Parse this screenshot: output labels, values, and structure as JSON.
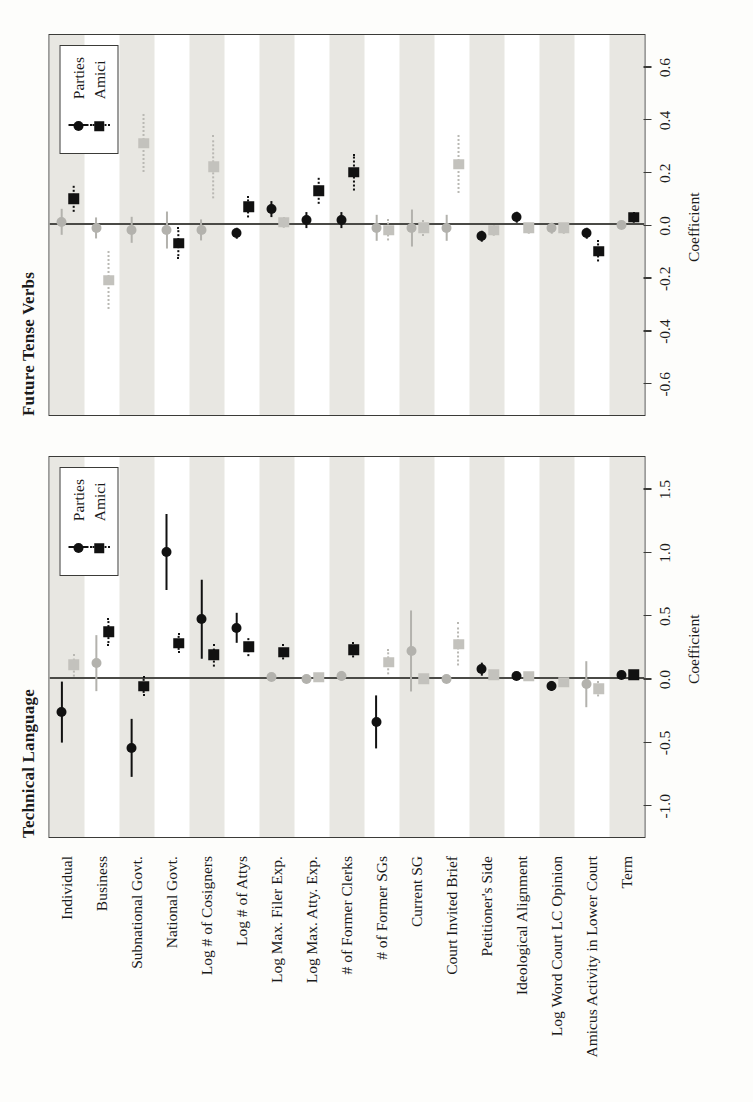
{
  "figure": {
    "orientation": "rotated-90-ccw",
    "xlabel": "Coefficient",
    "colors": {
      "significant": "#111111",
      "nonsignificant": "#b8b7b2",
      "band": "#e8e7e2",
      "frame": "#3b3b38"
    }
  },
  "legend": {
    "entries": [
      {
        "label": "Parties",
        "marker": "circle",
        "line": "solid"
      },
      {
        "label": "Amici",
        "marker": "square",
        "line": "dotted"
      }
    ]
  },
  "categories": [
    "Individual",
    "Business",
    "Subnational Govt.",
    "National Govt.",
    "Log # of Cosigners",
    "Log # of Attys",
    "Log Max. Filer Exp.",
    "Log Max. Atty. Exp.",
    "# of Former Clerks",
    "# of Former SGs",
    "Current SG",
    "Court Invited Brief",
    "Petitioner's Side",
    "Ideological Alignment",
    "Log Word Court LC Opinion",
    "Amicus Activity in Lower Court",
    "Term"
  ],
  "chart_data": [
    {
      "type": "scatter",
      "title": "Technical Language",
      "xlabel": "Coefficient",
      "ylabel": "",
      "xlim": [
        -1.25,
        1.75
      ],
      "xticks": [
        -1.0,
        -0.5,
        0.0,
        0.5,
        1.0,
        1.5
      ],
      "xticklabels": [
        "-1.0",
        "-0.5",
        "0.0",
        "0.5",
        "1.0",
        "1.5"
      ],
      "grid": false,
      "categories": [
        "Individual",
        "Business",
        "Subnational Govt.",
        "National Govt.",
        "Log # of Cosigners",
        "Log # of Attys",
        "Log Max. Filer Exp.",
        "Log Max. Atty. Exp.",
        "# of Former Clerks",
        "# of Former SGs",
        "Current SG",
        "Court Invited Brief",
        "Petitioner's Side",
        "Ideological Alignment",
        "Log Word Court LC Opinion",
        "Amicus Activity in Lower Court",
        "Term"
      ],
      "series": [
        {
          "name": "Parties",
          "marker": "circle",
          "line": "solid",
          "values": [
            -0.26,
            0.12,
            -0.55,
            1.0,
            0.47,
            0.4,
            0.01,
            0.0,
            0.02,
            -0.34,
            0.22,
            0.0,
            0.08,
            0.02,
            -0.06,
            -0.04,
            0.03
          ],
          "ci_low": [
            -0.5,
            -0.1,
            -0.78,
            0.7,
            0.16,
            0.28,
            -0.02,
            -0.03,
            -0.02,
            -0.55,
            -0.1,
            0.0,
            0.03,
            0.0,
            -0.1,
            -0.22,
            0.0
          ],
          "ci_high": [
            -0.02,
            0.34,
            -0.32,
            1.3,
            0.78,
            0.52,
            0.04,
            0.03,
            0.06,
            -0.13,
            0.54,
            0.0,
            0.13,
            0.04,
            -0.02,
            0.14,
            0.06
          ],
          "significant": [
            true,
            false,
            true,
            true,
            true,
            true,
            false,
            false,
            false,
            true,
            false,
            false,
            true,
            true,
            true,
            false,
            true
          ]
        },
        {
          "name": "Amici",
          "marker": "square",
          "line": "dotted",
          "values": [
            0.11,
            0.37,
            -0.06,
            0.28,
            0.19,
            0.25,
            0.21,
            0.01,
            0.23,
            0.13,
            0.0,
            0.27,
            0.03,
            0.02,
            -0.03,
            -0.08,
            0.03
          ],
          "ci_low": [
            0.02,
            0.26,
            -0.14,
            0.2,
            0.1,
            0.18,
            0.15,
            -0.01,
            0.17,
            0.03,
            -0.02,
            0.1,
            0.01,
            0.0,
            -0.05,
            -0.14,
            0.01
          ],
          "ci_high": [
            0.2,
            0.48,
            0.02,
            0.36,
            0.28,
            0.32,
            0.27,
            0.03,
            0.29,
            0.23,
            0.02,
            0.44,
            0.05,
            0.04,
            -0.01,
            -0.02,
            0.05
          ],
          "significant": [
            false,
            true,
            true,
            true,
            true,
            true,
            true,
            false,
            true,
            false,
            false,
            false,
            false,
            false,
            false,
            false,
            true
          ]
        }
      ]
    },
    {
      "type": "scatter",
      "title": "Future Tense Verbs",
      "xlabel": "Coefficient",
      "ylabel": "",
      "xlim": [
        -0.72,
        0.72
      ],
      "xticks": [
        -0.6,
        -0.4,
        -0.2,
        0.0,
        0.2,
        0.4,
        0.6
      ],
      "xticklabels": [
        "-0.6",
        "-0.4",
        "-0.2",
        "0.0",
        "0.2",
        "0.4",
        "0.6"
      ],
      "grid": false,
      "categories": [
        "Individual",
        "Business",
        "Subnational Govt.",
        "National Govt.",
        "Log # of Cosigners",
        "Log # of Attys",
        "Log Max. Filer Exp.",
        "Log Max. Atty. Exp.",
        "# of Former Clerks",
        "# of Former SGs",
        "Current SG",
        "Court Invited Brief",
        "Petitioner's Side",
        "Ideological Alignment",
        "Log Word Court LC Opinion",
        "Amicus Activity in Lower Court",
        "Term"
      ],
      "series": [
        {
          "name": "Parties",
          "marker": "circle",
          "line": "solid",
          "values": [
            0.01,
            -0.01,
            -0.02,
            -0.02,
            -0.02,
            -0.03,
            0.06,
            0.02,
            0.02,
            -0.01,
            -0.01,
            -0.01,
            -0.04,
            0.03,
            -0.01,
            -0.03,
            0.0
          ],
          "ci_low": [
            -0.04,
            -0.05,
            -0.07,
            -0.09,
            -0.06,
            -0.05,
            0.03,
            -0.01,
            -0.01,
            -0.06,
            -0.08,
            -0.06,
            -0.06,
            0.01,
            -0.03,
            -0.05,
            -0.01
          ],
          "ci_high": [
            0.06,
            0.03,
            0.03,
            0.05,
            0.02,
            -0.01,
            0.09,
            0.05,
            0.05,
            0.04,
            0.06,
            0.04,
            -0.02,
            0.05,
            0.01,
            -0.01,
            0.01
          ],
          "significant": [
            false,
            false,
            false,
            false,
            false,
            true,
            true,
            true,
            true,
            false,
            false,
            false,
            true,
            true,
            false,
            true,
            false
          ]
        },
        {
          "name": "Amici",
          "marker": "square",
          "line": "dotted",
          "values": [
            0.1,
            -0.21,
            0.31,
            -0.07,
            0.22,
            0.07,
            0.01,
            0.13,
            0.2,
            -0.02,
            -0.01,
            0.23,
            -0.02,
            -0.01,
            -0.01,
            -0.1,
            0.03
          ],
          "ci_low": [
            0.05,
            -0.32,
            0.2,
            -0.13,
            0.1,
            0.03,
            -0.01,
            0.08,
            0.13,
            -0.06,
            -0.04,
            0.12,
            -0.04,
            -0.03,
            -0.03,
            -0.14,
            0.01
          ],
          "ci_high": [
            0.15,
            -0.1,
            0.42,
            -0.01,
            0.34,
            0.11,
            0.03,
            0.18,
            0.27,
            0.02,
            0.02,
            0.34,
            0.0,
            0.01,
            0.01,
            -0.06,
            0.05
          ],
          "significant": [
            true,
            false,
            false,
            true,
            false,
            true,
            false,
            true,
            true,
            false,
            false,
            false,
            false,
            false,
            false,
            true,
            true
          ]
        }
      ]
    }
  ]
}
